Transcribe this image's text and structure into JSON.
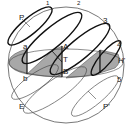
{
  "diagram": {
    "type": "celestial-sphere",
    "colors": {
      "stroke": "#222222",
      "shade": "#a8a8a8",
      "background": "#ffffff",
      "circle": "#555555"
    },
    "labels": {
      "P": "P",
      "n1": "1",
      "n2": "2",
      "n3": "3",
      "n4": "4",
      "n5": "5",
      "Hprime": "H'",
      "a": "a",
      "b": "b",
      "A": "A",
      "T": "T",
      "B": "B",
      "E": "E",
      "Pprime": "P'"
    }
  }
}
